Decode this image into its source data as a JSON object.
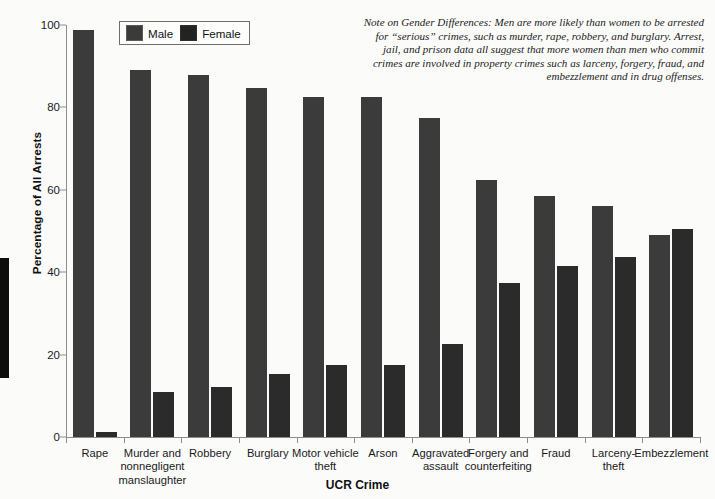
{
  "note": {
    "text": "Note on Gender Differences: Men are more likely than women to be arrested for “serious” crimes, such as murder, rape, robbery, and burglary. Arrest, jail, and prison data all suggest that more women than men who commit crimes are involved in property crimes such as larceny, forgery, fraud, and embezzlement and in drug offenses."
  },
  "legend": {
    "male_label": "Male",
    "female_label": "Female"
  },
  "colors": {
    "male_bar": "#3b3b3b",
    "female_bar": "#2b2b2b",
    "axis": "#8d8d8d",
    "text": "#1a1a1a",
    "background": "#fbfbfa"
  },
  "chart_data": {
    "type": "bar",
    "title": "",
    "subtitle": "",
    "xlabel": "UCR Crime",
    "ylabel": "Percentage of All Arrests",
    "ylim": [
      0,
      100
    ],
    "yticks": [
      0,
      20,
      40,
      60,
      80,
      100
    ],
    "ytick_labels": [
      "0",
      "20",
      "40",
      "60",
      "80",
      "100"
    ],
    "grid": false,
    "legend_position": "top-left-inside",
    "categories": [
      "Rape",
      "Murder and nonnegligent manslaughter",
      "Robbery",
      "Burglary",
      "Motor vehicle theft",
      "Arson",
      "Aggravated assault",
      "Forgery and counterfeiting",
      "Fraud",
      "Larceny-theft",
      "Embezzlement"
    ],
    "category_lines": [
      [
        "Rape"
      ],
      [
        "Murder and",
        "nonnegligent",
        "manslaughter"
      ],
      [
        "Robbery"
      ],
      [
        "Burglary"
      ],
      [
        "Motor vehicle",
        "theft"
      ],
      [
        "Arson"
      ],
      [
        "Aggravated",
        "assault"
      ],
      [
        "Forgery and",
        "counterfeiting"
      ],
      [
        "Fraud"
      ],
      [
        "Larceny-",
        "theft"
      ],
      [
        "Embezzlement"
      ]
    ],
    "series": [
      {
        "name": "Male",
        "values": [
          98.8,
          89.0,
          87.8,
          84.8,
          82.5,
          82.5,
          77.5,
          62.5,
          58.5,
          56.0,
          49.0
        ]
      },
      {
        "name": "Female",
        "values": [
          1.2,
          11.0,
          12.2,
          15.2,
          17.5,
          17.5,
          22.5,
          37.5,
          41.5,
          43.8,
          50.5
        ]
      }
    ]
  }
}
